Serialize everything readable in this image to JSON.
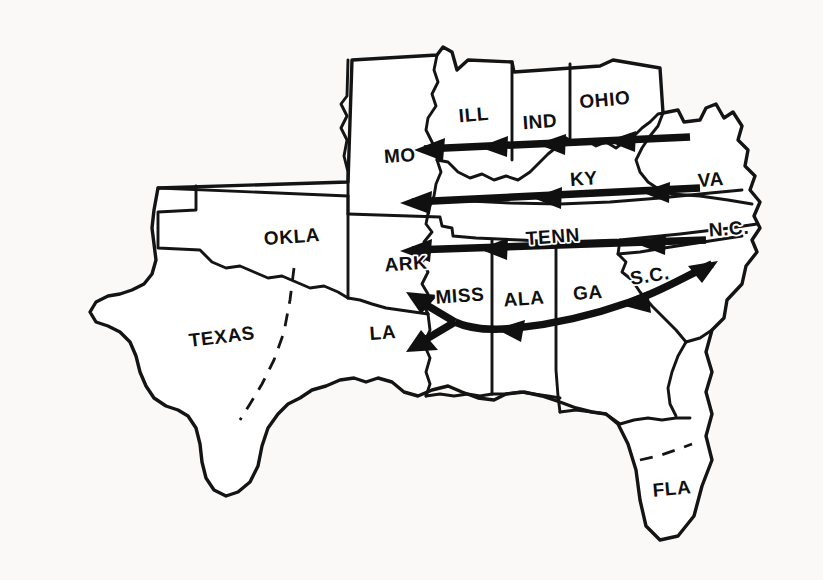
{
  "figure": {
    "kind": "map",
    "title": "",
    "region": "Southeastern and South-Central United States",
    "background_color": "#faf9f8",
    "line_color": "#141414",
    "arrow_color": "#101010",
    "fill_color": "#ffffff"
  },
  "states": [
    {
      "id": "texas",
      "label": "TEXAS",
      "x": 222,
      "y": 338,
      "rotate": -7
    },
    {
      "id": "okla",
      "label": "OKLA",
      "x": 292,
      "y": 238,
      "rotate": -4
    },
    {
      "id": "mo",
      "label": "MO",
      "x": 400,
      "y": 157,
      "rotate": -4
    },
    {
      "id": "ill",
      "label": "ILL",
      "x": 474,
      "y": 116,
      "rotate": -5
    },
    {
      "id": "ind",
      "label": "IND",
      "x": 540,
      "y": 123,
      "rotate": -4
    },
    {
      "id": "ohio",
      "label": "OHIO",
      "x": 605,
      "y": 101,
      "rotate": -5
    },
    {
      "id": "ky",
      "label": "KY",
      "x": 584,
      "y": 180,
      "rotate": -4
    },
    {
      "id": "va",
      "label": "VA",
      "x": 711,
      "y": 181,
      "rotate": -4
    },
    {
      "id": "tenn",
      "label": "TENN",
      "x": 553,
      "y": 238,
      "rotate": -4
    },
    {
      "id": "nc",
      "label": "N.C.",
      "x": 729,
      "y": 230,
      "rotate": -4
    },
    {
      "id": "ark",
      "label": "ARK",
      "x": 406,
      "y": 265,
      "rotate": -4
    },
    {
      "id": "miss",
      "label": "MISS",
      "x": 460,
      "y": 297,
      "rotate": -4
    },
    {
      "id": "ala",
      "label": "ALA",
      "x": 524,
      "y": 300,
      "rotate": -4
    },
    {
      "id": "ga",
      "label": "GA",
      "x": 588,
      "y": 294,
      "rotate": -4
    },
    {
      "id": "sc",
      "label": "S.C.",
      "x": 650,
      "y": 277,
      "rotate": -9
    },
    {
      "id": "la",
      "label": "LA",
      "x": 383,
      "y": 334,
      "rotate": -4
    },
    {
      "id": "fla",
      "label": "FLA",
      "x": 672,
      "y": 490,
      "rotate": -5
    }
  ],
  "flows": {
    "description": "Bold arrows showing migration direction westward and southwestward across the region",
    "arrows": [
      {
        "id": "flow-row-1",
        "label": "MO / ILL / IND / OHIO corridor",
        "origin": "OHIO",
        "destination": "MO",
        "direction": "westward",
        "heads": 4
      },
      {
        "id": "flow-row-2",
        "label": "VA / KY corridor",
        "origin": "VA",
        "destination": "MO",
        "direction": "westward",
        "heads": 3
      },
      {
        "id": "flow-row-3",
        "label": "N.C. / TENN corridor",
        "origin": "N.C.",
        "destination": "ARK",
        "direction": "westward",
        "heads": 3
      },
      {
        "id": "flow-curve-deep-south",
        "label": "S.C. / GA / ALA / MISS curved corridor",
        "origin": "S.C.",
        "destination": "LA / ARK",
        "direction": "southwestward",
        "heads": 4
      }
    ]
  }
}
